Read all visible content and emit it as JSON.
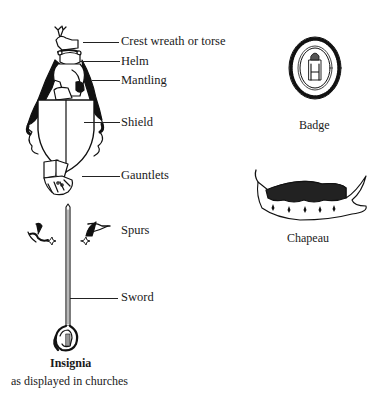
{
  "diagram": {
    "title": "Insignia",
    "subtitle": "as displayed in churches",
    "labels": [
      {
        "id": "crest",
        "text": "Crest wreath or torse"
      },
      {
        "id": "helm",
        "text": "Helm"
      },
      {
        "id": "mantling",
        "text": "Mantling"
      },
      {
        "id": "shield",
        "text": "Shield"
      },
      {
        "id": "gauntlets",
        "text": "Gauntlets"
      },
      {
        "id": "spurs",
        "text": "Spurs"
      },
      {
        "id": "sword",
        "text": "Sword"
      }
    ],
    "side_items": [
      {
        "id": "badge",
        "text": "Badge"
      },
      {
        "id": "chapeau",
        "text": "Chapeau"
      }
    ],
    "colors": {
      "ink": "#111111",
      "background": "#ffffff"
    }
  }
}
